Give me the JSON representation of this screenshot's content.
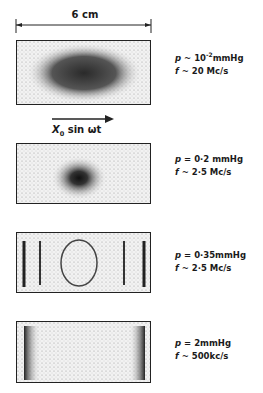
{
  "dimension": {
    "label": "6 cm"
  },
  "motion": {
    "symbol": "X",
    "subscript": "0",
    "expr": " sin ωt",
    "direction": "right"
  },
  "panels": [
    {
      "pressure_sym": "p",
      "pressure_rel": " ~ ",
      "pressure_base": "10",
      "pressure_exp": "-2",
      "pressure_unit": "mmHg",
      "freq_sym": "f",
      "freq_rel": " ~ ",
      "freq_value": "20  Mc/s",
      "pattern": "large-elliptical-cloud"
    },
    {
      "pressure_sym": "p",
      "pressure_rel": " = ",
      "pressure_value": "0·2  mmHg",
      "freq_sym": "f",
      "freq_rel": " ~ ",
      "freq_value": "2·5 Mc/s",
      "pattern": "central-dark-spot"
    },
    {
      "pressure_sym": "p",
      "pressure_rel": " = ",
      "pressure_value": "0·35mmHg",
      "freq_sym": "f",
      "freq_rel": " ~ ",
      "freq_value": "2·5 Mc/s",
      "pattern": "striations-with-ring"
    },
    {
      "pressure_sym": "p",
      "pressure_rel": " = ",
      "pressure_value": "2mmHg",
      "freq_sym": "f",
      "freq_rel": " ~ ",
      "freq_value": "500kc/s",
      "pattern": "edge-bands"
    }
  ]
}
